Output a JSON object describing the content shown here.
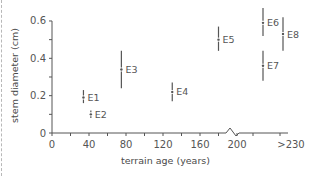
{
  "chart_data": {
    "type": "scatter",
    "title": "",
    "xlabel": "terrain age (years)",
    "ylabel": "stem diameter (cm)",
    "xlim": [
      0,
      240
    ],
    "ylim": [
      0,
      0.6
    ],
    "x_ticks": [
      "0",
      "40",
      "80",
      "120",
      "160",
      "200",
      ">230"
    ],
    "y_ticks": [
      "0",
      "0.2",
      "0.4",
      "0.6"
    ],
    "axis_break": "x-axis break between 200 and >230",
    "grid": false,
    "legend": null,
    "series": [
      {
        "name": "E1",
        "x": 34,
        "y": 0.19,
        "ymin": 0.16,
        "ymax": 0.23
      },
      {
        "name": "E2",
        "x": 42,
        "y": 0.1,
        "ymin": 0.08,
        "ymax": 0.12
      },
      {
        "name": "E3",
        "x": 75,
        "y": 0.34,
        "ymin": 0.24,
        "ymax": 0.44
      },
      {
        "name": "E4",
        "x": 130,
        "y": 0.22,
        "ymin": 0.17,
        "ymax": 0.27
      },
      {
        "name": "E5",
        "x": 180,
        "y": 0.5,
        "ymin": 0.44,
        "ymax": 0.57
      },
      {
        "name": "E6",
        "x": 230,
        "y": 0.59,
        "ymin": 0.52,
        "ymax": 0.67
      },
      {
        "name": "E7",
        "x": 230,
        "y": 0.36,
        "ymin": 0.28,
        "ymax": 0.44
      },
      {
        "name": "E8",
        "x": 244,
        "y": 0.53,
        "ymin": 0.44,
        "ymax": 0.62
      }
    ]
  },
  "labels": {
    "xlabel": "terrain age (years)",
    "ylabel": "stem diameter (cm)"
  }
}
